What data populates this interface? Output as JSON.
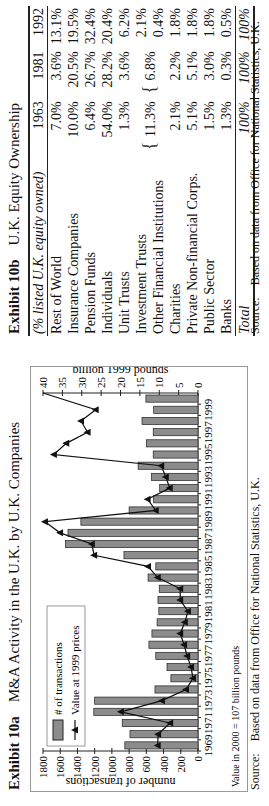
{
  "exhibit_a": {
    "label": "Exhibit 10a",
    "title": "M&A Activity in the U.K. by U.K. Companies",
    "note": "Value in 2000 = 107 billion pounds",
    "source_label": "Source:",
    "source_text": "Based on data from Office for National Statistics, U.K."
  },
  "exhibit_b": {
    "label": "Exhibit 10b",
    "title": "U.K. Equity Ownership",
    "source_label": "Source:",
    "source_text": "Based on data from Office for National Statistics, U.K.",
    "header": [
      "(% listed U.K. equity owned)",
      "1963",
      "1981",
      "1992"
    ],
    "rows": [
      {
        "name": "Rest of World",
        "v": [
          "7.0%",
          "3.6%",
          "13.1%"
        ]
      },
      {
        "name": "Insurance Companies",
        "v": [
          "10.0%",
          "20.5%",
          "19.5%"
        ]
      },
      {
        "name": "Pension Funds",
        "v": [
          "6.4%",
          "26.7%",
          "32.4%"
        ]
      },
      {
        "name": "Individuals",
        "v": [
          "54.0%",
          "28.2%",
          "20.4%"
        ]
      },
      {
        "name": "Unit Trusts",
        "v": [
          "1.3%",
          "3.6%",
          "6.2%"
        ]
      },
      {
        "name": "Investment Trusts",
        "v": [
          "",
          "",
          "2.1%"
        ]
      },
      {
        "name": "Other Financial Institutions",
        "v": [
          "",
          "",
          "0.4%"
        ]
      },
      {
        "name": "Charities",
        "v": [
          "2.1%",
          "2.2%",
          "1.8%"
        ]
      },
      {
        "name": "Private Non-financial Corps.",
        "v": [
          "5.1%",
          "5.1%",
          "1.8%"
        ]
      },
      {
        "name": "Public Sector",
        "v": [
          "1.5%",
          "3.0%",
          "1.8%"
        ]
      },
      {
        "name": "Banks",
        "v": [
          "1.3%",
          "0.3%",
          "0.5%"
        ]
      }
    ],
    "merged": {
      "1963": "11.3%",
      "1981": "6.8%"
    },
    "total": {
      "name": "Total",
      "v": [
        "100%",
        "100%",
        "100%"
      ]
    }
  },
  "chart_data": {
    "type": "bar",
    "title": "M&A Activity in the U.K. by U.K. Companies",
    "x": [
      1969,
      1970,
      1971,
      1972,
      1973,
      1974,
      1975,
      1976,
      1977,
      1978,
      1979,
      1980,
      1981,
      1982,
      1983,
      1984,
      1985,
      1986,
      1987,
      1988,
      1989,
      1990,
      1991,
      1992,
      1993,
      1994,
      1995,
      1996,
      1997,
      1998,
      1999,
      2000
    ],
    "xtick_labels": [
      "1969",
      "1971",
      "1973",
      "1975",
      "1977",
      "1979",
      "1981",
      "1983",
      "1985",
      "1987",
      "1989",
      "1991",
      "1993",
      "1995",
      "1997",
      "1999"
    ],
    "ylabel": "number of transactions",
    "ylim": [
      0,
      1800
    ],
    "yticks": [
      0,
      200,
      400,
      600,
      800,
      1000,
      1200,
      1400,
      1600,
      1800
    ],
    "y2label": "billion 1999 pounds",
    "y2lim": [
      0,
      40
    ],
    "y2ticks": [
      0,
      5,
      10,
      15,
      20,
      25,
      30,
      35,
      40
    ],
    "legend": [
      "# of transactions",
      "Value at 1999 prices"
    ],
    "legend_position": "top-left",
    "series": [
      {
        "name": "# of transactions",
        "type": "bar",
        "axis": "left",
        "values": [
          850,
          790,
          880,
          1210,
          1200,
          500,
          315,
          360,
          490,
          570,
          535,
          475,
          455,
          465,
          450,
          580,
          490,
          860,
          1540,
          1510,
          1360,
          800,
          515,
          445,
          540,
          695,
          520,
          600,
          520,
          650,
          515,
          605
        ]
      },
      {
        "name": "Value at 1999 prices",
        "type": "line",
        "axis": "right",
        "values": [
          10.4,
          10.3,
          7.2,
          19.9,
          9.3,
          3.1,
          1.3,
          1.8,
          2.8,
          3.6,
          4.6,
          3.4,
          2.6,
          4.6,
          4.6,
          10.4,
          12.9,
          26.8,
          27.4,
          35.6,
          39.5,
          10.9,
          13.0,
          7.3,
          8.3,
          9.5,
          37.2,
          34.0,
          28.5,
          30.2,
          26.4,
          107
        ]
      }
    ],
    "annotation": "Value in 2000 = 107 billion pounds"
  }
}
